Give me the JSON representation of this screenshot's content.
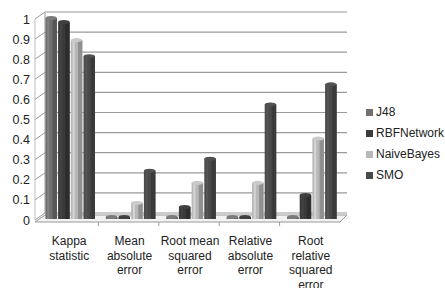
{
  "chart_data": {
    "type": "bar",
    "style": "3d-clustered-column",
    "title": "",
    "xlabel": "",
    "ylabel": "",
    "ylim": [
      0,
      1
    ],
    "yticks": [
      "0",
      "0.1",
      "0.2",
      "0.3",
      "0.4",
      "0.5",
      "0.6",
      "0.7",
      "0.8",
      "0.9",
      "1"
    ],
    "grid": true,
    "legend_position": "right",
    "categories": [
      [
        "Kappa",
        "statistic"
      ],
      [
        "Mean",
        "absolute",
        "error"
      ],
      [
        "Root mean",
        "squared",
        "error"
      ],
      [
        "Relative",
        "absolute",
        "error"
      ],
      [
        "Root",
        "relative",
        "squared",
        "error"
      ]
    ],
    "category_names": [
      "Kappa statistic",
      "Mean absolute error",
      "Root mean squared error",
      "Relative absolute error",
      "Root relative squared error"
    ],
    "series": [
      {
        "name": "J48",
        "color": "#707070",
        "values": [
          1.0,
          0.005,
          0.005,
          0.005,
          0.005
        ]
      },
      {
        "name": "RBFNetwork",
        "color": "#3a3a3a",
        "values": [
          0.98,
          0.01,
          0.06,
          0.01,
          0.12
        ]
      },
      {
        "name": "NaiveBayes",
        "color": "#b8b8b8",
        "values": [
          0.89,
          0.08,
          0.18,
          0.18,
          0.4
        ]
      },
      {
        "name": "SMO",
        "color": "#4a4a4a",
        "values": [
          0.81,
          0.24,
          0.3,
          0.57,
          0.67
        ]
      }
    ]
  }
}
